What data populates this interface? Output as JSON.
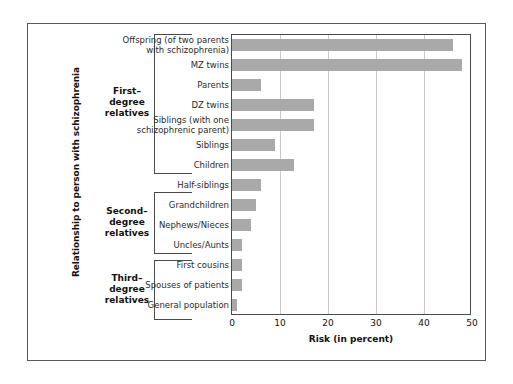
{
  "chart_data": {
    "type": "bar",
    "orientation": "horizontal",
    "title": "",
    "xlabel": "Risk (in percent)",
    "ylabel": "Relationship to person with schizophrenia",
    "xlim": [
      0,
      50
    ],
    "xticks": [
      0,
      10,
      20,
      30,
      40,
      50
    ],
    "xtick_labels": [
      "0",
      "10",
      "20",
      "30",
      "40",
      "50"
    ],
    "grid": "vertical",
    "legend": "none",
    "bar_color": "#a9a9a9",
    "categories": [
      "Offspring (of two parents with schizophrenia)",
      "MZ twins",
      "Parents",
      "DZ twins",
      "Siblings (with one schizophrenic parent)",
      "Siblings",
      "Children",
      "Half-siblings",
      "Grandchildren",
      "Nephews/Nieces",
      "Uncles/Aunts",
      "First cousins",
      "Spouses  of patients",
      "General population"
    ],
    "values": [
      46,
      48,
      6,
      17,
      17,
      9,
      13,
      6,
      5,
      4,
      2,
      2,
      2,
      1
    ],
    "groups": [
      {
        "label": "First–\ndegree\nrelatives",
        "label_lines": [
          "First–",
          "degree",
          "relatives"
        ],
        "categories": [
          "Offspring (of two parents with schizophrenia)",
          "MZ twins",
          "Parents",
          "DZ twins",
          "Siblings (with one schizophrenic parent)",
          "Siblings",
          "Children"
        ]
      },
      {
        "label": "Second–\ndegree\nrelatives",
        "label_lines": [
          "Second–",
          "degree",
          "relatives"
        ],
        "categories": [
          "Half-siblings",
          "Grandchildren",
          "Nephews/Nieces",
          "Uncles/Aunts"
        ]
      },
      {
        "label": "Third–\ndegree\nrelatives",
        "label_lines": [
          "Third–",
          "degree",
          "relatives"
        ],
        "categories": [
          "First cousins",
          "Spouses  of patients",
          "General population"
        ]
      }
    ]
  },
  "labels": {
    "cat_0_line_1": "Offspring (of two parents",
    "cat_0_line_2": "with schizophrenia)",
    "cat_1": "MZ twins",
    "cat_2": "Parents",
    "cat_3": "DZ twins",
    "cat_4_line_1": "Siblings (with one",
    "cat_4_line_2": "schizophrenic parent)",
    "cat_5": "Siblings",
    "cat_6": "Children",
    "cat_7": "Half-siblings",
    "cat_8": "Grandchildren",
    "cat_9": "Nephews/Nieces",
    "cat_10": "Uncles/Aunts",
    "cat_11": "First cousins",
    "cat_12": "Spouses  of patients",
    "cat_13": "General population"
  },
  "groups_text": {
    "g0_l1": "First–",
    "g0_l2": "degree",
    "g0_l3": "relatives",
    "g1_l1": "Second–",
    "g1_l2": "degree",
    "g1_l3": "relatives",
    "g2_l1": "Third–",
    "g2_l2": "degree",
    "g2_l3": "relatives"
  },
  "axis": {
    "x_title": "Risk (in percent)",
    "y_title": "Relationship to person with schizophrenia",
    "tick_0": "0",
    "tick_1": "10",
    "tick_2": "20",
    "tick_3": "30",
    "tick_4": "40",
    "tick_5": "50"
  }
}
